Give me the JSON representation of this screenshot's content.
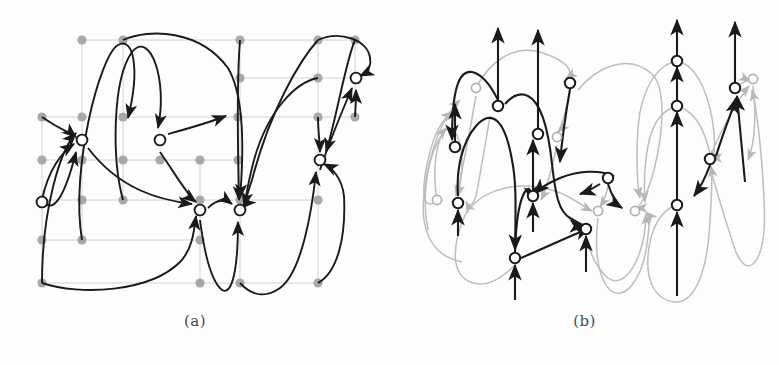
{
  "figure": {
    "kind": "two-panel-graph-drawing-figure",
    "background_color": "#fdfdfd",
    "panels": [
      {
        "id": "a",
        "caption": "(a)",
        "description": "Grid drawing: gray grid points and grid lines with white circular vertices joined by curved black directed edges",
        "node_fill": "#ffffff",
        "node_stroke": "#1a1a1a",
        "edge_color": "#1a1a1a",
        "grid_dot_color": "#a8a8a8",
        "grid_line_color": "#cfcfcf",
        "grid_columns_x": [
          42,
          82,
          123,
          160,
          200,
          240,
          280,
          318,
          355
        ],
        "grid_rows_y": [
          40,
          78,
          117,
          140,
          160,
          200,
          240,
          283
        ],
        "grid_points": [
          [
            82,
            40
          ],
          [
            123,
            40
          ],
          [
            240,
            40
          ],
          [
            318,
            40
          ],
          [
            355,
            40
          ],
          [
            240,
            78
          ],
          [
            318,
            78
          ],
          [
            355,
            78
          ],
          [
            42,
            117
          ],
          [
            82,
            117
          ],
          [
            123,
            117
          ],
          [
            238,
            117
          ],
          [
            318,
            117
          ],
          [
            355,
            117
          ],
          [
            42,
            160
          ],
          [
            82,
            160
          ],
          [
            123,
            160
          ],
          [
            160,
            160
          ],
          [
            200,
            160
          ],
          [
            238,
            160
          ],
          [
            42,
            200
          ],
          [
            82,
            200
          ],
          [
            123,
            200
          ],
          [
            200,
            200
          ],
          [
            240,
            200
          ],
          [
            318,
            200
          ],
          [
            42,
            240
          ],
          [
            82,
            240
          ],
          [
            200,
            240
          ],
          [
            42,
            283
          ],
          [
            200,
            283
          ],
          [
            240,
            283
          ],
          [
            318,
            283
          ]
        ],
        "nodes": [
          {
            "id": "v1",
            "x": 82,
            "y": 140
          },
          {
            "id": "v2",
            "x": 160,
            "y": 140
          },
          {
            "id": "v3",
            "x": 42,
            "y": 202
          },
          {
            "id": "v4",
            "x": 200,
            "y": 210
          },
          {
            "id": "v5",
            "x": 240,
            "y": 210
          },
          {
            "id": "v6",
            "x": 320,
            "y": 160
          },
          {
            "id": "v7",
            "x": 356,
            "y": 78
          }
        ]
      },
      {
        "id": "b",
        "caption": "(b)",
        "description": "Upward drawing of the same graph: black emphasised edges over light gray edges, all arrows pointing upward",
        "node_fill": "#ffffff",
        "node_stroke_dark": "#1a1a1a",
        "node_stroke_light": "#b0b0b0",
        "edge_color_dark": "#1a1a1a",
        "edge_color_light": "#bdbdbd",
        "nodes_dark": [
          {
            "id": "b1",
            "x": 455,
            "y": 147
          },
          {
            "id": "b2",
            "x": 458,
            "y": 203
          },
          {
            "id": "b3",
            "x": 498,
            "y": 106
          },
          {
            "id": "b4",
            "x": 570,
            "y": 83
          },
          {
            "id": "b5",
            "x": 538,
            "y": 134
          },
          {
            "id": "b6",
            "x": 533,
            "y": 196
          },
          {
            "id": "b7",
            "x": 608,
            "y": 178
          },
          {
            "id": "b8",
            "x": 515,
            "y": 258
          },
          {
            "id": "b9",
            "x": 586,
            "y": 229
          },
          {
            "id": "b10",
            "x": 677,
            "y": 61
          },
          {
            "id": "b11",
            "x": 677,
            "y": 106
          },
          {
            "id": "b12",
            "x": 677,
            "y": 205
          },
          {
            "id": "b13",
            "x": 735,
            "y": 88
          },
          {
            "id": "b14",
            "x": 710,
            "y": 159
          }
        ],
        "nodes_light": [
          {
            "id": "g1",
            "x": 437,
            "y": 200
          },
          {
            "id": "g2",
            "x": 476,
            "y": 88
          },
          {
            "id": "g3",
            "x": 557,
            "y": 137
          },
          {
            "id": "g4",
            "x": 598,
            "y": 211
          },
          {
            "id": "g5",
            "x": 635,
            "y": 211
          },
          {
            "id": "g6",
            "x": 753,
            "y": 79
          }
        ]
      }
    ]
  }
}
